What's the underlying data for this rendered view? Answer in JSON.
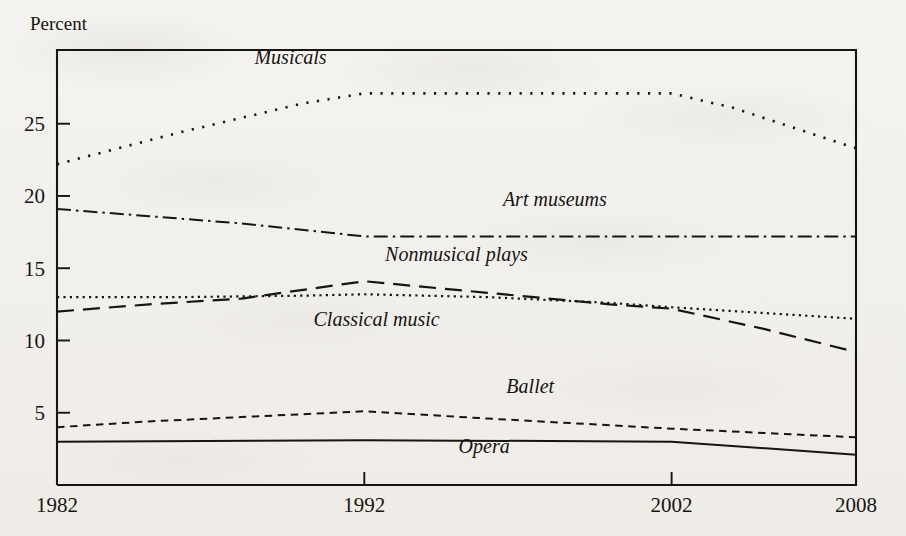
{
  "figure": {
    "y_axis_title": "Percent",
    "y_ticks": [
      "25",
      "20",
      "15",
      "10",
      "5"
    ],
    "x_ticks": [
      "1982",
      "1992",
      "2002",
      "2008"
    ]
  },
  "labels": {
    "musicals": "Musicals",
    "art_museums": "Art museums",
    "nonmusical_plays": "Nonmusical plays",
    "classical_music": "Classical music",
    "ballet": "Ballet",
    "opera": "Opera"
  },
  "colors": {
    "ink": "#17150f",
    "paper": "#f4f2ee"
  },
  "chart_data": {
    "type": "line",
    "title": "",
    "subtitle": "",
    "xlabel": "",
    "ylabel": "Percent",
    "xlim": [
      1982,
      2008
    ],
    "ylim": [
      0,
      30.1
    ],
    "grid": false,
    "legend": "inline data labels",
    "y_tick_values": [
      25,
      20,
      15,
      10,
      5
    ],
    "x_tick_values": [
      1982,
      1992,
      2002,
      2008
    ],
    "note": "Percent of U.S. adults attending each type of arts event; lines distinguished by dash pattern rather than color.",
    "series": [
      {
        "name": "Musicals",
        "dash_pattern": "dotted",
        "stroke_dasharray": "2.2 8.5",
        "stroke_width": 2.6,
        "label_position": {
          "x": 1989.6,
          "y": 29.1
        },
        "x": [
          1982,
          1984,
          1986,
          1988,
          1990,
          1992,
          1994,
          1996,
          1998,
          2000,
          2002,
          2004,
          2006,
          2008
        ],
        "values": [
          22.2,
          23.3,
          24.4,
          25.4,
          26.4,
          27.1,
          27.1,
          27.1,
          27.1,
          27.1,
          27.1,
          26.1,
          24.7,
          23.3
        ]
      },
      {
        "name": "Art museums",
        "dash_pattern": "dash-dot",
        "stroke_dasharray": "14 5 2.5 5",
        "stroke_width": 2.0,
        "label_position": {
          "x": 1998.2,
          "y": 19.3
        },
        "x": [
          1982,
          1985,
          1988,
          1992,
          1996,
          2002,
          2008
        ],
        "values": [
          19.1,
          18.6,
          18.1,
          17.2,
          17.2,
          17.2,
          17.2
        ]
      },
      {
        "name": "Nonmusical plays",
        "dash_pattern": "long-dash",
        "stroke_dasharray": "17 9",
        "stroke_width": 2.2,
        "label_position": {
          "x": 1995.0,
          "y": 15.5
        },
        "x": [
          1982,
          1985,
          1988,
          1992,
          1996,
          2000,
          2002,
          2005,
          2008
        ],
        "values": [
          12.0,
          12.5,
          12.9,
          14.1,
          13.3,
          12.5,
          12.2,
          10.8,
          9.2
        ]
      },
      {
        "name": "Classical music",
        "dash_pattern": "fine-dotted",
        "stroke_dasharray": "2.2 4.2",
        "stroke_width": 2.2,
        "label_position": {
          "x": 1992.4,
          "y": 11.0
        },
        "x": [
          1982,
          1986,
          1990,
          1992,
          1996,
          2000,
          2002,
          2005,
          2008
        ],
        "values": [
          13.0,
          13.0,
          13.1,
          13.2,
          13.0,
          12.6,
          12.3,
          11.9,
          11.5
        ]
      },
      {
        "name": "Ballet",
        "dash_pattern": "short-dash",
        "stroke_dasharray": "7.5 5.5",
        "stroke_width": 2.0,
        "label_position": {
          "x": 1997.4,
          "y": 6.4
        },
        "x": [
          1982,
          1985,
          1988,
          1992,
          1996,
          2002,
          2005,
          2008
        ],
        "values": [
          4.0,
          4.4,
          4.7,
          5.1,
          4.6,
          3.9,
          3.6,
          3.3
        ]
      },
      {
        "name": "Opera",
        "dash_pattern": "solid",
        "stroke_dasharray": "",
        "stroke_width": 2.0,
        "label_position": {
          "x": 1995.9,
          "y": 2.2
        },
        "x": [
          1982,
          1992,
          2002,
          2008
        ],
        "values": [
          3.0,
          3.1,
          3.0,
          2.1
        ]
      }
    ]
  }
}
